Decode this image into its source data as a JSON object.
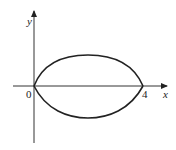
{
  "diagram": {
    "type": "region-between-curves",
    "axes": {
      "x_label": "x",
      "y_label": "y",
      "origin_label": "0",
      "x_tick_label": "4"
    },
    "curves": [
      {
        "name": "upper-curve",
        "description": "arc above x-axis from 0 to 4"
      },
      {
        "name": "lower-curve",
        "description": "arc below x-axis from 0 to 4"
      }
    ],
    "colors": {
      "stroke": "#222222",
      "background": "#ffffff"
    }
  }
}
